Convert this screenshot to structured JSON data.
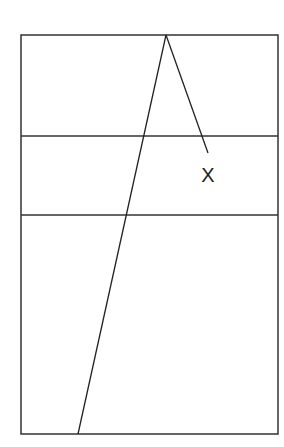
{
  "diagram": {
    "stroke_color": "#333333",
    "background_color": "#ffffff",
    "frame": {
      "x1": 21,
      "y1": 35,
      "x2": 278,
      "y2": 434
    },
    "horizontal_lines": [
      {
        "y": 136
      },
      {
        "y": 215
      }
    ],
    "apex": {
      "x": 166,
      "y": 35
    },
    "left_line_end": {
      "x": 78,
      "y": 434
    },
    "right_line_end": {
      "x": 208,
      "y": 153
    },
    "labels": [
      {
        "text": "X",
        "x": 208,
        "y": 182
      }
    ]
  }
}
